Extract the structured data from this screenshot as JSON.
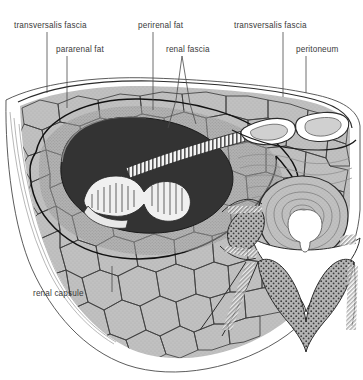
{
  "figure": {
    "type": "anatomical-cross-section",
    "background_color": "#ffffff",
    "text_color": "#3a3a3a",
    "leader_color": "#4a4a4a"
  },
  "labels": [
    {
      "id": "transversalis-fascia-left",
      "text": "transversalis fascia",
      "text_x": 14,
      "text_y": 28,
      "leader": "M47,32 L47,93"
    },
    {
      "id": "pararenal-fat",
      "text": "pararenal fat",
      "text_x": 56,
      "text_y": 52,
      "leader": "M67,56 L67,108"
    },
    {
      "id": "perirenal-fat",
      "text": "perirenal fat",
      "text_x": 138,
      "text_y": 28,
      "leader": "M153,32 L153,110"
    },
    {
      "id": "renal-fascia",
      "text": "renal fascia",
      "text_x": 166,
      "text_y": 52,
      "leader": "M182,56 L176,100 L168,128 M182,56 L190,104 L196,124"
    },
    {
      "id": "transversalis-fascia-right",
      "text": "transversalis fascia",
      "text_x": 234,
      "text_y": 28,
      "leader": "M283,32 L283,97"
    },
    {
      "id": "peritoneum",
      "text": "peritoneum",
      "text_x": 296,
      "text_y": 52,
      "leader": "M306,56 L306,93"
    },
    {
      "id": "renal-capsule",
      "text": "renal capsule",
      "text_x": 33,
      "text_y": 296,
      "leader": "M112,292 L112,266"
    }
  ],
  "structures": [
    {
      "id": "body-wall-outline",
      "name": "body wall outline",
      "color": "#4a4a4a"
    },
    {
      "id": "fat-cells-layer",
      "name": "pararenal / perirenal adipose tissue",
      "color": "#b8b8b8"
    },
    {
      "id": "kidney",
      "name": "kidney",
      "color": "#3a3a3a"
    },
    {
      "id": "renal-pelvis",
      "name": "renal pelvis and ureter",
      "color": "#f2f2f2"
    },
    {
      "id": "vertebral-body",
      "name": "vertebral body",
      "color": "#b0b0b0"
    },
    {
      "id": "spinal-cord",
      "name": "spinal cord",
      "color": "#ffffff"
    },
    {
      "id": "spinal-canal",
      "name": "vertebral canal",
      "color": "#ffffff"
    },
    {
      "id": "erector-spinae",
      "name": "erector spinae muscle",
      "color": "#9a9a9a"
    },
    {
      "id": "great-vessels",
      "name": "aorta and inferior vena cava",
      "color": "#ffffff"
    },
    {
      "id": "flank-muscle",
      "name": "abdominal flank musculature",
      "color": "#ffffff"
    },
    {
      "id": "renal-fascia-line",
      "name": "renal fascia",
      "color": "#1a1a1a"
    }
  ]
}
